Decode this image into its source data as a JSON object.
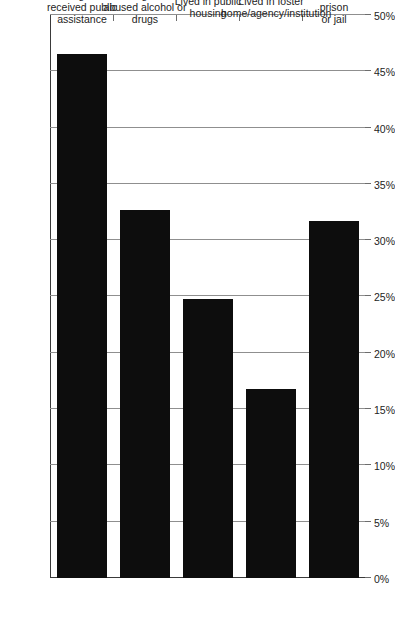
{
  "chart_data": {
    "type": "bar",
    "orientation": "horizontal-rotated",
    "title": "",
    "subtitle": "",
    "xlabel": "",
    "ylabel": "",
    "categories": [
      "Parents/guardians\nreceived public\nassistance",
      "Parents/guardians\nabused alcohol or drugs",
      "Lived in public housing",
      "Lived in foster\nhome/agency/institution",
      "Parents ever in prison\nor jail"
    ],
    "values": [
      46.5,
      32.7,
      24.8,
      16.8,
      31.7
    ],
    "value_labels": [
      "46.5%",
      "32.7%",
      "24.8%",
      "16.8%",
      "31.7%"
    ],
    "ylim": [
      0,
      50
    ],
    "tick_values": [
      0,
      5,
      10,
      15,
      20,
      25,
      30,
      35,
      40,
      45,
      50
    ],
    "tick_labels": [
      "0%",
      "5%",
      "10%",
      "15%",
      "20%",
      "25%",
      "30%",
      "35%",
      "40%",
      "45%",
      "50%"
    ],
    "grid": true,
    "legend": "none",
    "bar_color": "#0d0d0d",
    "axis_color": "#3a3a3a",
    "grid_color": "#8f8f8f",
    "annotations": []
  }
}
